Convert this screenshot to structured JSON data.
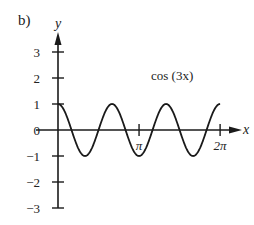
{
  "panel_label": "b)",
  "chart_data": {
    "type": "line",
    "title": "",
    "annotation": "cos (3x)",
    "xlabel": "x",
    "ylabel": "y",
    "function": "cos(3x)",
    "xlim": [
      0,
      6.2832
    ],
    "ylim": [
      -3,
      3
    ],
    "x_ticks": [
      {
        "value": 3.1416,
        "label": "π"
      },
      {
        "value": 6.2832,
        "label": "2π"
      }
    ],
    "y_ticks": [
      {
        "value": 3,
        "label": "3"
      },
      {
        "value": 2,
        "label": "2"
      },
      {
        "value": 1,
        "label": "1"
      },
      {
        "value": 0,
        "label": "0"
      },
      {
        "value": -1,
        "label": "−1"
      },
      {
        "value": -2,
        "label": "−2"
      },
      {
        "value": -3,
        "label": "−3"
      }
    ],
    "series": [
      {
        "name": "cos (3x)",
        "x": [
          0,
          0.5236,
          1.0472,
          1.5708,
          2.0944,
          2.618,
          3.1416,
          3.6652,
          4.1888,
          4.7124,
          5.236,
          5.7596,
          6.2832
        ],
        "values": [
          1,
          0,
          -1,
          0,
          1,
          0,
          -1,
          0,
          1,
          0,
          -1,
          0,
          1
        ]
      }
    ],
    "grid": false,
    "legend": "none",
    "axes_style": "arrows-through-origin"
  },
  "layout": {
    "origin_px": [
      58,
      130
    ],
    "x_unit_px": 25.8,
    "y_unit_px": 26,
    "line_color": "#1a1a1a",
    "text_color": "#222222"
  }
}
